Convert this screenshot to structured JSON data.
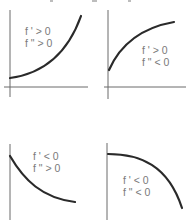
{
  "panels": [
    {
      "id": "increasing-convex",
      "first_derivative_label": "f ' > 0",
      "second_derivative_label": "f \" > 0",
      "shape": "increasing, concave up"
    },
    {
      "id": "increasing-concave",
      "first_derivative_label": "f ' > 0",
      "second_derivative_label": "f \" < 0",
      "shape": "increasing, concave down"
    },
    {
      "id": "decreasing-convex",
      "first_derivative_label": "f ' < 0",
      "second_derivative_label": "f \" > 0",
      "shape": "decreasing, concave up"
    },
    {
      "id": "decreasing-concave",
      "first_derivative_label": "f ' < 0",
      "second_derivative_label": "f \" < 0",
      "shape": "decreasing, concave down"
    }
  ],
  "colors": {
    "curve": "#2a2a2a",
    "axis": "#6a6a6a",
    "label": "#7a7a7a"
  }
}
